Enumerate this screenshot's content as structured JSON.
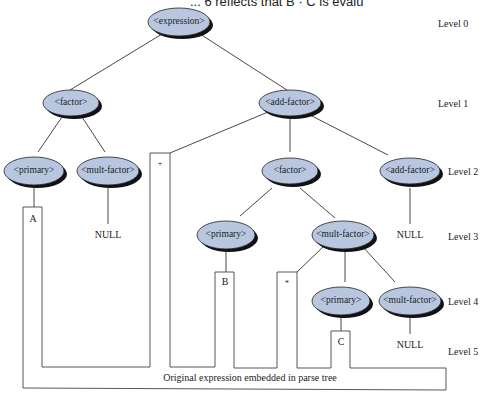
{
  "header": {
    "cut_text": "... 6 reflects that B · C is evalu"
  },
  "tree": {
    "nodes": [
      {
        "id": "expression",
        "label": "<expression>",
        "level": 0
      },
      {
        "id": "factor1",
        "label": "<factor>",
        "level": 1
      },
      {
        "id": "addfactor1",
        "label": "<add-factor>",
        "level": 1
      },
      {
        "id": "primary1",
        "label": "<primary>",
        "level": 2
      },
      {
        "id": "multfactor1",
        "label": "<mult-factor>",
        "level": 2
      },
      {
        "id": "factor2",
        "label": "<factor>",
        "level": 2
      },
      {
        "id": "addfactor2",
        "label": "<add-factor>",
        "level": 2
      },
      {
        "id": "primary2",
        "label": "<primary>",
        "level": 3
      },
      {
        "id": "multfactor2",
        "label": "<mult-factor>",
        "level": 3
      },
      {
        "id": "primary3",
        "label": "<primary>",
        "level": 4
      },
      {
        "id": "multfactor3",
        "label": "<mult-factor>",
        "level": 4
      }
    ],
    "leaves": {
      "null1": "NULL",
      "null2": "NULL",
      "null3": "NULL"
    },
    "tokens": {
      "a": "A",
      "plus": "+",
      "b": "B",
      "times": "*",
      "c": "C"
    }
  },
  "levels": [
    "Level 0",
    "Level 1",
    "Level 2",
    "Level 3",
    "Level 4",
    "Level 5"
  ],
  "caption": "Original expression embedded in parse tree"
}
